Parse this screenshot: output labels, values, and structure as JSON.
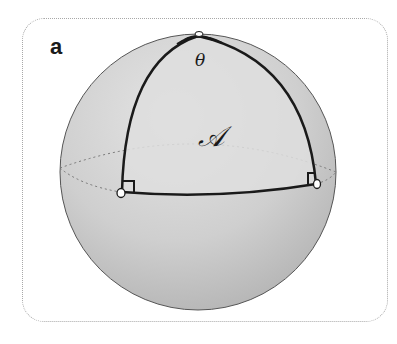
{
  "figure": {
    "panel_label": "a",
    "angle_label": "θ",
    "area_label": "𝒜"
  },
  "colors": {
    "sphere_fill": "#c9c9c9",
    "sphere_highlight": "#e2e2e2",
    "triangle_fill": "#dcdcdc",
    "stroke": "#1a1a1a",
    "frame": "#a8a8a8"
  }
}
